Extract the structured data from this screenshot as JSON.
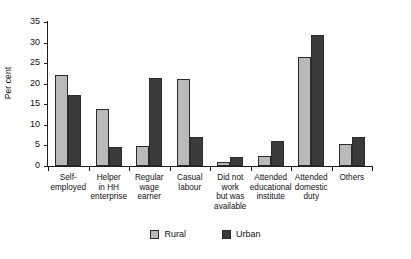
{
  "chart_data": {
    "type": "bar",
    "title": "",
    "xlabel": "",
    "ylabel": "Per cent",
    "ylim": [
      0,
      35
    ],
    "yticks": [
      0,
      5,
      10,
      15,
      20,
      25,
      30,
      35
    ],
    "grid": false,
    "legend_position": "bottom-center",
    "categories": [
      "Self-\nemployed",
      "Helper\nin HH\nenterprise",
      "Regular\nwage\nearner",
      "Casual\nlabour",
      "Did not\nwork\nbut was\navailable",
      "Attended\neducational\ninstitute",
      "Attended\ndomestic\nduty",
      "Others"
    ],
    "series": [
      {
        "name": "Rural",
        "color": "#b9b9b9",
        "values": [
          22.2,
          13.8,
          4.8,
          21.2,
          1.0,
          2.4,
          26.5,
          5.4
        ]
      },
      {
        "name": "Urban",
        "color": "#3b3b3b",
        "values": [
          17.3,
          4.7,
          21.5,
          7.0,
          2.2,
          6.0,
          31.8,
          7.1
        ]
      }
    ]
  },
  "axis": {
    "y_title": "Per cent",
    "y_tick_labels": [
      "0",
      "5",
      "10",
      "15",
      "20",
      "25",
      "30",
      "35"
    ]
  },
  "legend": {
    "items": [
      {
        "label": "Rural"
      },
      {
        "label": "Urban"
      }
    ]
  }
}
